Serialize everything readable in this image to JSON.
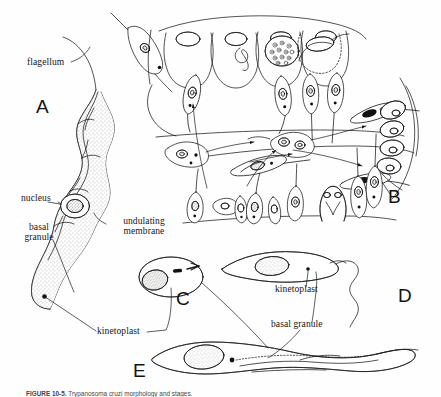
{
  "figure": {
    "kind": "scientific-line-drawing",
    "background_color": "#fefefe",
    "ink_color": "#1a1a1a",
    "stipple_color": "#6e6a63",
    "panels": [
      {
        "id": "A",
        "letter": "A",
        "x": 36,
        "y": 96,
        "description": "Large detailed trypomastigote with flagellum, undulating membrane, nucleus, basal granule, kinetoplast"
      },
      {
        "id": "B",
        "letter": "B",
        "x": 388,
        "y": 186,
        "description": "Tissue section showing amastigote and trypomastigote stages with arrows indicating transformation"
      },
      {
        "id": "C",
        "letter": "C",
        "x": 176,
        "y": 288,
        "description": "Enlarged detail of kinetoplast and basal granule"
      },
      {
        "id": "D",
        "letter": "D",
        "x": 398,
        "y": 285,
        "description": "Epimastigote / crithidial form with kinetoplast anterior to nucleus"
      },
      {
        "id": "E",
        "letter": "E",
        "x": 133,
        "y": 360,
        "description": "Trypomastigote with posterior kinetoplast and undulating membrane"
      }
    ],
    "labels": [
      {
        "name": "flagellum",
        "text": "flagellum",
        "x": 27,
        "y": 63,
        "panel": "A"
      },
      {
        "name": "nucleus",
        "text": "nucleus",
        "x": 22,
        "y": 199,
        "panel": "A"
      },
      {
        "name": "basal-granule-a",
        "text": "basal\ngranule",
        "line1": "basal",
        "line2": "granule",
        "x": 12,
        "y": 227,
        "panel": "A"
      },
      {
        "name": "undulating-membrane",
        "text": "undulating\nmembrane",
        "line1": "undulating",
        "line2": "membrane",
        "x": 111,
        "y": 221,
        "panel": "A"
      },
      {
        "name": "kinetoplast-left",
        "text": "kinetoplast",
        "x": 98,
        "y": 333,
        "panel": "A-C-E"
      },
      {
        "name": "kinetoplast-right",
        "text": "kinetoplast",
        "x": 276,
        "y": 290,
        "panel": "D"
      },
      {
        "name": "basal-granule-right",
        "text": "basal granule",
        "x": 272,
        "y": 325,
        "panel": "C-D-E"
      }
    ],
    "caption": {
      "prefix": "FIGURE 10-5.",
      "rest": "Trypanosoma cruzi morphology and stages.",
      "clipped": true
    }
  }
}
